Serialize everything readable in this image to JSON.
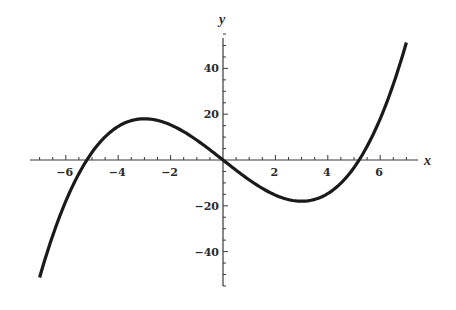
{
  "chart_data": {
    "type": "line",
    "title": "",
    "xlabel": "x",
    "ylabel": "y",
    "function": "y = x^3/3 - 9x",
    "xlim": [
      -7.3,
      7.5
    ],
    "ylim": [
      -55,
      57
    ],
    "x_ticks": [
      -6,
      -4,
      -2,
      2,
      4,
      6
    ],
    "x_tick_labels": [
      "−6",
      "−4",
      "−2",
      "2",
      "4",
      "6"
    ],
    "y_ticks": [
      40,
      20,
      -20,
      -40
    ],
    "y_tick_labels": [
      "40",
      "20",
      "−20",
      "−40"
    ],
    "x_minor_step": 0.5,
    "y_minor_step": 5,
    "grid": false,
    "legend": null,
    "series": [
      {
        "name": "curve",
        "color": "#1a1a1a",
        "domain": [
          -7,
          7
        ],
        "x": [
          -7,
          -6,
          -5.196,
          -5,
          -4,
          -3,
          -2,
          -1,
          0,
          1,
          2,
          3,
          4,
          5,
          5.196,
          6,
          7
        ],
        "values": [
          -51.3,
          -18,
          0,
          3.3,
          14.7,
          18,
          15.3,
          8.7,
          0,
          -8.7,
          -15.3,
          -18,
          -14.7,
          -3.3,
          0,
          18,
          51.3
        ]
      }
    ],
    "annotations": {
      "local_max": [
        -3,
        18
      ],
      "local_min": [
        3,
        -18
      ],
      "roots": [
        -5.196,
        0,
        5.196
      ]
    }
  },
  "axes": {
    "x_label": "x",
    "y_label": "y"
  }
}
